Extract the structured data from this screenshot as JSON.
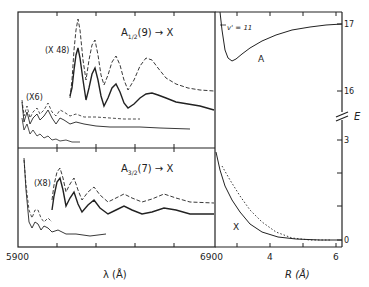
{
  "figure": {
    "left_panel": {
      "xlabel": "λ (Å)",
      "x_tick_left": "5900",
      "x_tick_right": "6900",
      "top": {
        "title_main": "A",
        "title_sub": "1/2",
        "title_rest": "(9) → X",
        "scale_big": "(X 48)",
        "scale_small": "(X6)"
      },
      "bottom": {
        "title_main": "A",
        "title_sub": "3/2",
        "title_rest": "(7) → X",
        "scale": "(X8)"
      }
    },
    "right_panel": {
      "xlabel": "R (Å)",
      "x_ticks": [
        "4",
        "6"
      ],
      "ylabel": "E",
      "y_ticks_upper": [
        "17",
        "16"
      ],
      "y_ticks_lower": [
        "3",
        "0"
      ],
      "curve_upper_label": "A",
      "curve_lower_label": "X",
      "level_label": "v' = 11"
    }
  },
  "colors": {
    "ink": "#222222",
    "background": "#ffffff"
  }
}
